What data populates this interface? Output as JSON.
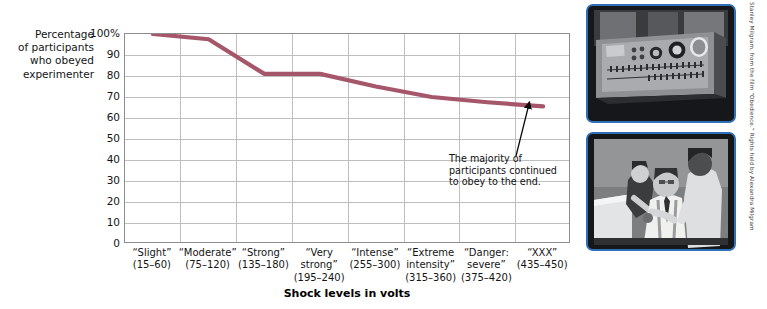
{
  "axis": {
    "y_caption_lines": [
      "Percentage",
      "of participants",
      "who obeyed",
      "experimenter"
    ],
    "y_ticks": [
      "100%",
      "90",
      "80",
      "70",
      "60",
      "50",
      "40",
      "30",
      "20",
      "10",
      "0"
    ],
    "x_title": "Shock levels in volts"
  },
  "annotation": {
    "lines": [
      "The majority of",
      "participants continued",
      "to obey to the end."
    ]
  },
  "credit": {
    "text": "Stanley Milgram, from the film “Obedience.” Rights held by Alexandra Milgram"
  },
  "photos": [
    {
      "name": "shock-generator-photo",
      "alt": "Milgram shock generator machine with dials and switches"
    },
    {
      "name": "learner-strapped-photo",
      "alt": "Learner being strapped into the chair by experimenter and assistant"
    }
  ],
  "colors": {
    "line": "#a6566b",
    "grid": "#bfbfbf",
    "frame": "#8d8d8d",
    "photo_border": "#2f6fb5",
    "text": "#141414"
  },
  "chart_data": {
    "type": "line",
    "title": "",
    "xlabel": "Shock levels in volts",
    "ylabel": "Percentage of participants who obeyed experimenter",
    "ylim": [
      0,
      100
    ],
    "ytick_values": [
      100,
      90,
      80,
      70,
      60,
      50,
      40,
      30,
      20,
      10,
      0
    ],
    "grid": true,
    "legend": "none",
    "categories": [
      "“Slight” (15–60)",
      "“Moderate” (75–120)",
      "“Strong” (135–180)",
      "“Very strong” (195–240)",
      "“Intense” (255–300)",
      "“Extreme intensity” (315–360)",
      "“Danger: severe” (375–420)",
      "“XXX” (435–450)"
    ],
    "category_label_lines": [
      [
        "“Slight”",
        "(15–60)"
      ],
      [
        "“Moderate”",
        "(75–120)"
      ],
      [
        "“Strong”",
        "(135–180)"
      ],
      [
        "“Very",
        "strong”",
        "(195–240)"
      ],
      [
        "“Intense”",
        "(255–300)"
      ],
      [
        "“Extreme",
        "intensity”",
        "(315–360)"
      ],
      [
        "“Danger:",
        "severe”",
        "(375–420)"
      ],
      [
        "“XXX”",
        "(435–450)"
      ]
    ],
    "values": [
      100,
      97.5,
      81,
      81,
      75,
      70,
      67.5,
      65.5
    ],
    "annotations": [
      {
        "text": "The majority of participants continued to obey to the end.",
        "points_to_category": "“XXX” (435–450)",
        "points_to_value": 65.5
      }
    ]
  }
}
